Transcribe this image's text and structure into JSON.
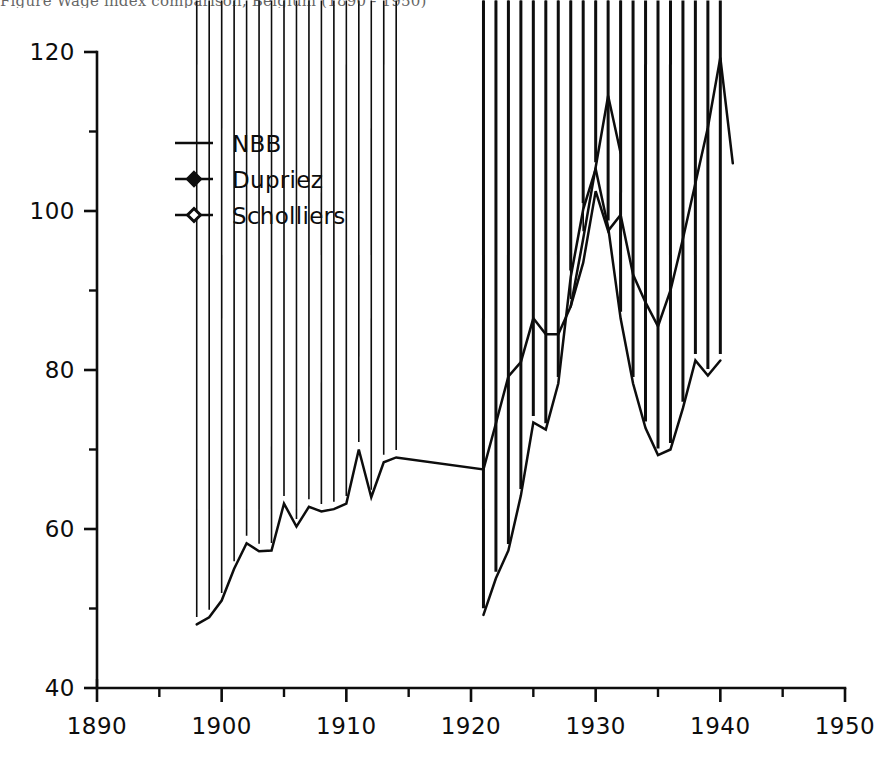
{
  "figure": {
    "top_caption": "Figure   Wage  index  comparison,  Belgium   (1890 - 1950)",
    "background_color": "#ffffff",
    "ink_color": "#0d0d0d"
  },
  "legend": {
    "position": "upper-left-inside",
    "entries": [
      {
        "label": "NBB",
        "marker": "none",
        "icon": "line-sample-icon"
      },
      {
        "label": "Dupriez",
        "marker": "filled-diamond",
        "icon": "filled-diamond-icon"
      },
      {
        "label": "Scholliers",
        "marker": "open-diamond",
        "icon": "open-diamond-icon"
      }
    ]
  },
  "chart_data": {
    "type": "line",
    "title": "",
    "xlabel": "",
    "ylabel": "",
    "xlim": [
      1890,
      1950
    ],
    "ylim": [
      40,
      120
    ],
    "x_major_ticks": [
      1890,
      1900,
      1910,
      1920,
      1930,
      1940,
      1950
    ],
    "x_minor_ticks": [
      1895,
      1905,
      1915,
      1925,
      1935,
      1945
    ],
    "y_major_ticks": [
      40,
      60,
      80,
      100,
      120
    ],
    "y_minor_ticks": [
      50,
      70,
      90,
      110
    ],
    "x_tick_labels": [
      "1890",
      "1900",
      "1910",
      "1920",
      "1930",
      "1940",
      "1950"
    ],
    "y_tick_labels": [
      "40",
      "60",
      "80",
      "100",
      "120"
    ],
    "grid": false,
    "legend_position": "upper left",
    "series": [
      {
        "name": "NBB",
        "marker": "none",
        "x": [
          1928,
          1929,
          1930,
          1931,
          1932,
          1933,
          1934,
          1935,
          1936,
          1937,
          1938,
          1939,
          1940,
          1941
        ],
        "values": [
          88.0,
          93.5,
          102.5,
          97.5,
          99.5,
          92.0,
          88.5,
          85.5,
          90.0,
          96.5,
          103.5,
          110.5,
          119.3,
          106.0
        ]
      },
      {
        "name": "Dupriez",
        "marker": "filled-diamond",
        "x": [
          1898,
          1899,
          1900,
          1901,
          1902,
          1903,
          1904,
          1905,
          1906,
          1907,
          1908,
          1909,
          1910,
          1911,
          1912,
          1913,
          1914,
          1921,
          1922,
          1923,
          1924,
          1925,
          1926,
          1927,
          1928,
          1929,
          1930,
          1931,
          1932
        ],
        "values": [
          48.0,
          48.9,
          51.0,
          55.0,
          58.2,
          57.2,
          57.3,
          63.2,
          60.3,
          62.8,
          62.2,
          62.5,
          63.2,
          70.0,
          64.0,
          68.4,
          69.0,
          67.5,
          73.3,
          79.2,
          81.0,
          86.5,
          84.5,
          84.5,
          88.0,
          96.5,
          105.5,
          114.5,
          107.3
        ]
      },
      {
        "name": "Scholliers",
        "marker": "open-diamond",
        "x": [
          1921,
          1922,
          1923,
          1924,
          1925,
          1926,
          1927,
          1928,
          1929,
          1930,
          1931,
          1932,
          1933,
          1934,
          1935,
          1936,
          1937,
          1938,
          1939,
          1940
        ],
        "values": [
          49.2,
          53.8,
          57.3,
          64.2,
          73.4,
          72.5,
          78.3,
          91.7,
          100.2,
          105.3,
          98.0,
          86.5,
          78.3,
          72.7,
          69.3,
          70.0,
          75.2,
          81.2,
          79.3,
          81.2
        ]
      }
    ]
  }
}
